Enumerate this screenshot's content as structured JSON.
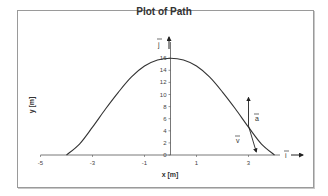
{
  "chart_data": {
    "type": "line",
    "title": "Plot of Path",
    "xlabel": "x [m]",
    "ylabel": "y [m]",
    "xlim": [
      -5,
      4.5
    ],
    "ylim": [
      0,
      16
    ],
    "x_ticks": [
      -5,
      -3,
      -1,
      1,
      3
    ],
    "y_ticks": [
      0,
      2,
      4,
      6,
      8,
      10,
      12,
      14,
      16
    ],
    "grid": false,
    "legend": "none",
    "series": [
      {
        "name": "path",
        "x": [
          -4,
          -3.5,
          -3,
          -2.5,
          -2,
          -1.5,
          -1,
          -0.5,
          0,
          0.5,
          1,
          1.5,
          2,
          2.5,
          3,
          3.5,
          4
        ],
        "y": [
          0,
          1.8,
          4.6,
          7.6,
          10.4,
          12.9,
          14.7,
          15.7,
          16,
          15.7,
          14.7,
          12.9,
          10.4,
          7.6,
          4.6,
          1.8,
          0
        ]
      }
    ],
    "annotations": [
      {
        "label": "a",
        "type": "vector",
        "from": [
          3,
          4.8
        ],
        "to": [
          3,
          9.5
        ],
        "note": "acceleration vector"
      },
      {
        "label": "v",
        "type": "vector",
        "from": [
          3,
          4.8
        ],
        "to": [
          3.3,
          0.5
        ],
        "note": "velocity vector"
      },
      {
        "label": "i",
        "type": "unit-vector",
        "axis": "x"
      },
      {
        "label": "j",
        "type": "unit-vector",
        "axis": "y"
      }
    ]
  },
  "title": "Plot of Path",
  "axes": {
    "xlabel": "x [m]",
    "ylabel": "y [m]",
    "x_tick_labels": [
      "-5",
      "-3",
      "-1",
      "1",
      "3"
    ],
    "y_tick_labels": [
      "0",
      "2",
      "4",
      "6",
      "8",
      "10",
      "12",
      "14",
      "16"
    ],
    "x_unit": "i",
    "y_unit": "j"
  },
  "vectors": {
    "a_label": "a",
    "v_label": "v"
  }
}
